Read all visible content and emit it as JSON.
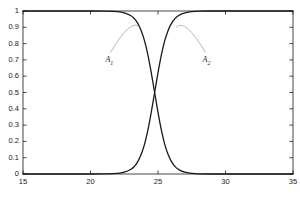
{
  "chart_data": {
    "type": "line",
    "title": "",
    "subtitle": "",
    "xlabel": "",
    "ylabel": "",
    "xlim": [
      15,
      35
    ],
    "ylim": [
      0,
      1
    ],
    "grid": false,
    "legend": "none",
    "x_ticks": [
      "15",
      "20",
      "25",
      "30",
      "35"
    ],
    "x_tick_values": [
      15,
      20,
      25,
      30,
      35
    ],
    "y_ticks": [
      "0",
      "0.1",
      "0.2",
      "0.3",
      "0.4",
      "0.5",
      "0.6",
      "0.7",
      "0.8",
      "0.9",
      "1"
    ],
    "y_tick_values": [
      0,
      0.1,
      0.2,
      0.3,
      0.4,
      0.5,
      0.6,
      0.7,
      0.8,
      0.9,
      1
    ],
    "crossing_point": {
      "x": 25,
      "y": 0.5
    },
    "annotations": [
      {
        "name": "A1",
        "label": "A",
        "subscript": "1",
        "text": "A₁",
        "x": 21.4,
        "y": 0.695
      },
      {
        "name": "A2",
        "label": "A",
        "subscript": "2",
        "text": "A₂",
        "x": 28.6,
        "y": 0.695
      }
    ],
    "series": [
      {
        "name": "A1",
        "label": "A₁",
        "color": "#1a1a1a",
        "description": "decreasing sigmoid membership function, 1 to 0, inflection at x=25",
        "x": [
          15,
          16,
          17,
          18,
          19,
          20,
          21,
          22,
          22.5,
          23,
          23.25,
          23.5,
          23.75,
          24,
          24.25,
          24.5,
          24.75,
          25,
          25.25,
          25.5,
          25.75,
          26,
          26.25,
          26.5,
          26.75,
          27,
          27.5,
          28,
          29,
          30,
          31,
          32,
          33,
          34,
          35
        ],
        "values": [
          1,
          1,
          1,
          1,
          1,
          1,
          0.999,
          0.996,
          0.989,
          0.971,
          0.953,
          0.924,
          0.881,
          0.818,
          0.731,
          0.622,
          0.5,
          0.378,
          0.269,
          0.182,
          0.119,
          0.076,
          0.047,
          0.029,
          0.018,
          0.011,
          0.004,
          0.001,
          0,
          0,
          0,
          0,
          0,
          0,
          0
        ]
      },
      {
        "name": "A2",
        "label": "A₂",
        "color": "#1a1a1a",
        "description": "increasing sigmoid membership function, 0 to 1, inflection at x=25",
        "x": [
          15,
          16,
          17,
          18,
          19,
          20,
          21,
          22,
          22.5,
          23,
          23.25,
          23.5,
          23.75,
          24,
          24.25,
          24.5,
          24.75,
          25,
          25.25,
          25.5,
          25.75,
          26,
          26.25,
          26.5,
          26.75,
          27,
          27.5,
          28,
          29,
          30,
          31,
          32,
          33,
          34,
          35
        ],
        "values": [
          0,
          0,
          0,
          0,
          0,
          0,
          0.001,
          0.004,
          0.011,
          0.029,
          0.047,
          0.076,
          0.119,
          0.182,
          0.269,
          0.378,
          0.5,
          0.622,
          0.731,
          0.818,
          0.881,
          0.924,
          0.953,
          0.971,
          0.982,
          0.989,
          0.996,
          0.999,
          1,
          1,
          1,
          1,
          1,
          1,
          1
        ]
      }
    ]
  },
  "style": {
    "curve_color": "#1a1a1a",
    "axis_color": "#1a1a1a",
    "leader_color": "#9a9a9a",
    "background": "#ffffff"
  }
}
